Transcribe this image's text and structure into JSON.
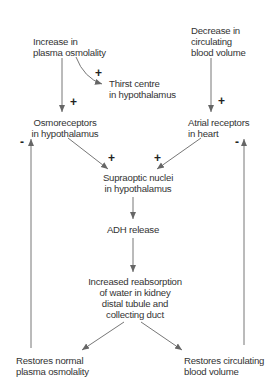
{
  "diagram": {
    "nodes": {
      "plasma_osmolality": "Increase in\nplasma osmolality",
      "thirst_centre": "Thirst centre\nin hypothalamus",
      "blood_volume": "Decrease in\ncirculating\nblood volume",
      "osmoreceptors": "Osmoreceptors\nin hypothalamus",
      "atrial_receptors": "Atrial receptors\nin heart",
      "supraoptic": "Supraoptic nuclei\nin hypothalamus",
      "adh_release": "ADH release",
      "reabsorption": "Increased reabsorption\nof water in kidney\ndistal tubule and\ncollecting duct",
      "restore_osmolality": "Restores normal\nplasma osmolality",
      "restore_volume": "Restores circulating\nblood volume"
    },
    "signs": {
      "thirst_plus": "+",
      "osmo_plus": "+",
      "atrial_plus": "+",
      "supra_left_plus": "+",
      "supra_right_plus": "+",
      "left_minus": "-",
      "right_minus": "-"
    },
    "edges": [
      {
        "from": "plasma_osmolality",
        "to": "thirst_centre",
        "sign": "+"
      },
      {
        "from": "plasma_osmolality",
        "to": "osmoreceptors",
        "sign": "+"
      },
      {
        "from": "blood_volume",
        "to": "atrial_receptors",
        "sign": "+"
      },
      {
        "from": "osmoreceptors",
        "to": "supraoptic",
        "sign": "+"
      },
      {
        "from": "atrial_receptors",
        "to": "supraoptic",
        "sign": "+"
      },
      {
        "from": "supraoptic",
        "to": "adh_release"
      },
      {
        "from": "adh_release",
        "to": "reabsorption"
      },
      {
        "from": "reabsorption",
        "to": "restore_osmolality"
      },
      {
        "from": "reabsorption",
        "to": "restore_volume"
      },
      {
        "from": "restore_osmolality",
        "to": "osmoreceptors",
        "sign": "-"
      },
      {
        "from": "restore_volume",
        "to": "atrial_receptors",
        "sign": "-"
      }
    ],
    "colors": {
      "arrow": "#666666",
      "text": "#333333",
      "background": "#ffffff"
    }
  }
}
